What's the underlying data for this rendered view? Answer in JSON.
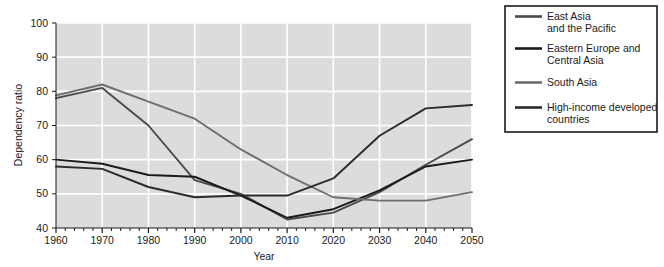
{
  "chart_data": {
    "type": "line",
    "title": "",
    "xlabel": "Year",
    "ylabel": "Dependency ratio",
    "xlim": [
      1960,
      2050
    ],
    "ylim": [
      40,
      100
    ],
    "xticks": [
      1960,
      1970,
      1980,
      1990,
      2000,
      2010,
      2020,
      2030,
      2040,
      2050
    ],
    "yticks": [
      40,
      50,
      60,
      70,
      80,
      90,
      100
    ],
    "minor_x_tick_step": 2,
    "grid": true,
    "grid_color": "#ffffff",
    "plot_background": "#dcdcdc",
    "legend_position": "right-outside",
    "x": [
      1960,
      1970,
      1980,
      1990,
      2000,
      2010,
      2020,
      2030,
      2040,
      2050
    ],
    "series": [
      {
        "name": "East Asia and the Pacific",
        "color": "#4a4a4a",
        "values": [
          78.0,
          81.0,
          70.0,
          54.0,
          50.0,
          42.5,
          44.5,
          50.5,
          58.5,
          66.0
        ]
      },
      {
        "name": "Eastern Europe and Central Asia",
        "color": "#1a1a1a",
        "values": [
          60.0,
          58.8,
          55.5,
          55.0,
          49.5,
          43.0,
          45.5,
          51.0,
          58.0,
          60.0
        ]
      },
      {
        "name": "South Asia",
        "color": "#6e6e6e",
        "values": [
          78.8,
          82.0,
          77.0,
          72.0,
          63.0,
          55.5,
          49.0,
          48.0,
          48.0,
          50.5
        ]
      },
      {
        "name": "High-income developed countries",
        "color": "#2b2b2b",
        "values": [
          58.0,
          57.3,
          52.0,
          49.0,
          49.5,
          49.5,
          54.5,
          67.0,
          75.0,
          76.0
        ]
      }
    ]
  },
  "legend": {
    "entries": [
      {
        "label_line1": "East Asia",
        "label_line2": "and the Pacific",
        "swatch": "#4a4a4a"
      },
      {
        "label_line1": "Eastern Europe and",
        "label_line2": "Central Asia",
        "swatch": "#1a1a1a"
      },
      {
        "label_line1": "South Asia",
        "label_line2": "",
        "swatch": "#6e6e6e"
      },
      {
        "label_line1": "High-income developed",
        "label_line2": "countries",
        "swatch": "#2b2b2b"
      }
    ]
  },
  "axes": {
    "x_title": "Year",
    "y_title": "Dependency ratio",
    "x_tick_labels": [
      "1960",
      "1970",
      "1980",
      "1990",
      "2000",
      "2010",
      "2020",
      "2030",
      "2040",
      "2050"
    ],
    "y_tick_labels": [
      "40",
      "50",
      "60",
      "70",
      "80",
      "90",
      "100"
    ]
  }
}
